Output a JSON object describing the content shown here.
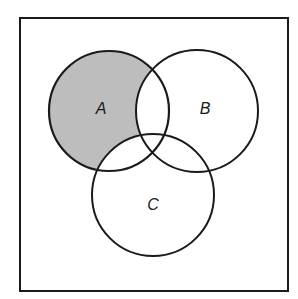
{
  "diagram": {
    "type": "venn",
    "universe": {
      "x": 20,
      "y": 18,
      "width": 268,
      "height": 273
    },
    "sets": [
      {
        "label": "A",
        "cx": 109,
        "cy": 111,
        "r": 60,
        "label_x": 101,
        "label_y": 114
      },
      {
        "label": "B",
        "cx": 197,
        "cy": 111,
        "r": 61,
        "label_x": 205,
        "label_y": 114
      },
      {
        "label": "C",
        "cx": 153,
        "cy": 195,
        "r": 61,
        "label_x": 153,
        "label_y": 210
      }
    ],
    "shaded_region": "A only (A minus B minus C)",
    "colors": {
      "shade": "#bdbdbd",
      "stroke": "#1a1a1a",
      "background": "#ffffff"
    }
  }
}
